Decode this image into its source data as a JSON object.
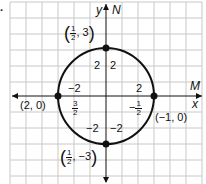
{
  "problem_marker": ".",
  "axes": {
    "x_label": "x",
    "y_label": "y",
    "x_line_label": "M",
    "y_line_label": "N"
  },
  "points": [
    {
      "name": "top",
      "label_num": "1",
      "label_den": "2",
      "label_y": "3"
    },
    {
      "name": "bottom",
      "label_num": "1",
      "label_den": "2",
      "label_y": "−3"
    },
    {
      "name": "left",
      "label": "(2, 0)"
    },
    {
      "name": "right",
      "label": "(−1, 0)"
    }
  ],
  "segment_labels": {
    "upper_left": "2",
    "upper_right": "2",
    "left_top": "−2",
    "right_top": "2",
    "left_frac_num": "3",
    "left_frac_den": "2",
    "right_frac_sign": "−",
    "right_frac_num": "1",
    "right_frac_den": "2",
    "lower_left": "−2",
    "lower_right": "−2"
  },
  "colors": {
    "grid": "#c8c8c8",
    "ink": "#111111"
  }
}
